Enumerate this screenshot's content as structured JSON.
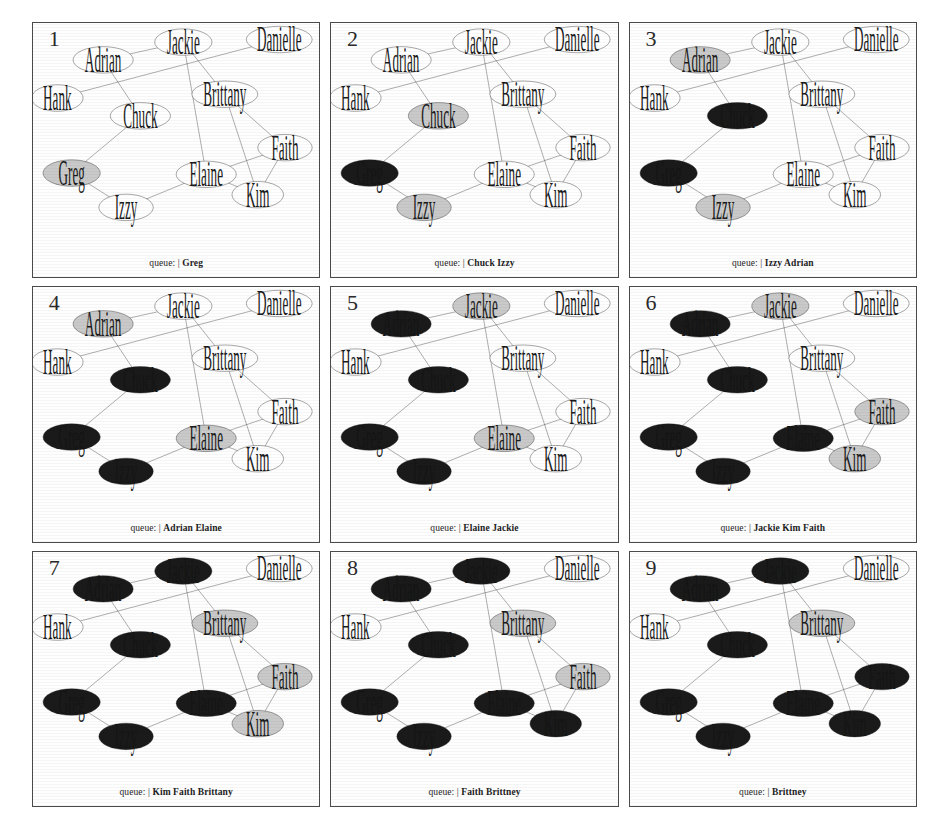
{
  "figure": {
    "panel_count": 9,
    "queue_prefix": "queue:",
    "queue_separator": "|"
  },
  "legend": {
    "white": "undiscovered",
    "gray": "discovered-in-queue",
    "black": "processed"
  },
  "colors": {
    "node_white": "#ffffff",
    "node_gray": "#c9c9c9",
    "node_black": "#1a1a1a",
    "node_stroke": "#1a1a1a",
    "edge": "#2a2a2a",
    "label_white_bg": "#1a1a1a",
    "label_black_bg": "#151515",
    "panel_border": "#4a4a4a",
    "background": "#ffffff"
  },
  "graph": {
    "nodes": [
      {
        "id": "adrian",
        "label": "Adrian",
        "x": 24.5,
        "y": 14.5,
        "rx": 10.5,
        "ry": 5.2
      },
      {
        "id": "jackie",
        "label": "Jackie",
        "x": 52.5,
        "y": 7.5,
        "rx": 10.0,
        "ry": 5.2
      },
      {
        "id": "danielle",
        "label": "Danielle",
        "x": 86.0,
        "y": 6.5,
        "rx": 11.5,
        "ry": 5.2
      },
      {
        "id": "hank",
        "label": "Hank",
        "x": 8.5,
        "y": 29.5,
        "rx": 9.0,
        "ry": 5.2
      },
      {
        "id": "brittany",
        "label": "Brittany",
        "x": 67.0,
        "y": 28.0,
        "rx": 11.5,
        "ry": 5.2
      },
      {
        "id": "chuck",
        "label": "Chuck",
        "x": 37.5,
        "y": 36.5,
        "rx": 10.5,
        "ry": 5.2
      },
      {
        "id": "faith",
        "label": "Faith",
        "x": 88.0,
        "y": 49.0,
        "rx": 9.5,
        "ry": 5.2
      },
      {
        "id": "greg",
        "label": "Greg",
        "x": 13.5,
        "y": 59.0,
        "rx": 10.0,
        "ry": 5.2
      },
      {
        "id": "elaine",
        "label": "Elaine",
        "x": 60.5,
        "y": 59.5,
        "rx": 10.5,
        "ry": 5.2
      },
      {
        "id": "kim",
        "label": "Kim",
        "x": 78.5,
        "y": 67.5,
        "rx": 9.0,
        "ry": 5.2
      },
      {
        "id": "izzy",
        "label": "Izzy",
        "x": 32.5,
        "y": 72.5,
        "rx": 9.5,
        "ry": 5.2
      }
    ],
    "edges": [
      {
        "from": "adrian",
        "to": "jackie"
      },
      {
        "from": "adrian",
        "to": "chuck"
      },
      {
        "from": "hank",
        "to": "danielle"
      },
      {
        "from": "jackie",
        "to": "elaine"
      },
      {
        "from": "jackie",
        "to": "brittany"
      },
      {
        "from": "chuck",
        "to": "greg"
      },
      {
        "from": "greg",
        "to": "izzy"
      },
      {
        "from": "izzy",
        "to": "elaine"
      },
      {
        "from": "brittany",
        "to": "kim"
      },
      {
        "from": "brittany",
        "to": "faith"
      },
      {
        "from": "elaine",
        "to": "faith"
      },
      {
        "from": "elaine",
        "to": "kim"
      },
      {
        "from": "faith",
        "to": "kim"
      }
    ]
  },
  "panels": [
    {
      "number": "1",
      "queue_items": "Greg",
      "queue_text": "queue: | Greg",
      "states": {
        "adrian": "white",
        "jackie": "white",
        "danielle": "white",
        "hank": "white",
        "brittany": "white",
        "chuck": "white",
        "faith": "white",
        "greg": "gray",
        "elaine": "white",
        "kim": "white",
        "izzy": "white"
      }
    },
    {
      "number": "2",
      "queue_items": "Chuck Izzy",
      "queue_text": "queue: | Chuck Izzy",
      "states": {
        "adrian": "white",
        "jackie": "white",
        "danielle": "white",
        "hank": "white",
        "brittany": "white",
        "chuck": "gray",
        "faith": "white",
        "greg": "black",
        "elaine": "white",
        "kim": "white",
        "izzy": "gray"
      }
    },
    {
      "number": "3",
      "queue_items": "Izzy Adrian",
      "queue_text": "queue: | Izzy Adrian",
      "states": {
        "adrian": "gray",
        "jackie": "white",
        "danielle": "white",
        "hank": "white",
        "brittany": "white",
        "chuck": "black",
        "faith": "white",
        "greg": "black",
        "elaine": "white",
        "kim": "white",
        "izzy": "gray"
      }
    },
    {
      "number": "4",
      "queue_items": "Adrian Elaine",
      "queue_text": "queue: | Adrian Elaine",
      "states": {
        "adrian": "gray",
        "jackie": "white",
        "danielle": "white",
        "hank": "white",
        "brittany": "white",
        "chuck": "black",
        "faith": "white",
        "greg": "black",
        "elaine": "gray",
        "kim": "white",
        "izzy": "black"
      }
    },
    {
      "number": "5",
      "queue_items": "Elaine Jackie",
      "queue_text": "queue: | Elaine Jackie",
      "states": {
        "adrian": "black",
        "jackie": "gray",
        "danielle": "white",
        "hank": "white",
        "brittany": "white",
        "chuck": "black",
        "faith": "white",
        "greg": "black",
        "elaine": "gray",
        "kim": "white",
        "izzy": "black"
      }
    },
    {
      "number": "6",
      "queue_items": "Jackie Kim Faith",
      "queue_text": "queue: | Jackie Kim Faith",
      "states": {
        "adrian": "black",
        "jackie": "gray",
        "danielle": "white",
        "hank": "white",
        "brittany": "white",
        "chuck": "black",
        "faith": "gray",
        "greg": "black",
        "elaine": "black",
        "kim": "gray",
        "izzy": "black"
      }
    },
    {
      "number": "7",
      "queue_items": "Kim Faith Brittany",
      "queue_text": "queue: | Kim Faith Brittany",
      "states": {
        "adrian": "black",
        "jackie": "black",
        "danielle": "white",
        "hank": "white",
        "brittany": "gray",
        "chuck": "black",
        "faith": "gray",
        "greg": "black",
        "elaine": "black",
        "kim": "gray",
        "izzy": "black"
      }
    },
    {
      "number": "8",
      "queue_items": "Faith Brittney",
      "queue_text": "queue: | Faith Brittney",
      "states": {
        "adrian": "black",
        "jackie": "black",
        "danielle": "white",
        "hank": "white",
        "brittany": "gray",
        "chuck": "black",
        "faith": "gray",
        "greg": "black",
        "elaine": "black",
        "kim": "black",
        "izzy": "black"
      }
    },
    {
      "number": "9",
      "queue_items": "Brittney",
      "queue_text": "queue: | Brittney",
      "states": {
        "adrian": "black",
        "jackie": "black",
        "danielle": "white",
        "hank": "white",
        "brittany": "gray",
        "chuck": "black",
        "faith": "black",
        "greg": "black",
        "elaine": "black",
        "kim": "black",
        "izzy": "black"
      }
    }
  ]
}
